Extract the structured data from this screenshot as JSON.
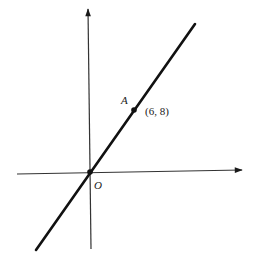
{
  "diagram": {
    "type": "coordinate-plane",
    "axes": {
      "x_axis": {
        "from": [
          17,
          174
        ],
        "to": [
          243,
          170
        ],
        "arrow": "right"
      },
      "y_axis": {
        "from": [
          91,
          249
        ],
        "to": [
          88,
          8
        ],
        "arrow": "up"
      }
    },
    "line": {
      "from": [
        36,
        250
      ],
      "to": [
        195,
        24
      ],
      "passes_through": [
        "O",
        "A"
      ]
    },
    "points": [
      {
        "id": "O",
        "label": "O",
        "coords_px": [
          90,
          172
        ]
      },
      {
        "id": "A",
        "label": "A",
        "coords_px": [
          134,
          110
        ],
        "coordinate_label": "(6, 8)"
      }
    ],
    "colors": {
      "ink": "#1a1a1a",
      "axis": "#333333",
      "background": "#ffffff"
    }
  }
}
